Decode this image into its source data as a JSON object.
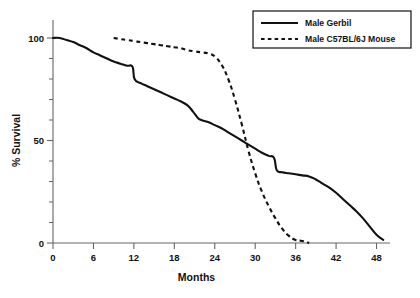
{
  "chart_data": {
    "type": "line",
    "title": "",
    "xlabel": "Months",
    "ylabel": "% Survival",
    "xlim": [
      0,
      50
    ],
    "ylim": [
      0,
      100
    ],
    "xticks": [
      0,
      6,
      12,
      18,
      24,
      30,
      36,
      42,
      48
    ],
    "xtick_labels": [
      "0",
      "6",
      "12",
      "18",
      "24",
      "30",
      "36",
      "42",
      "48"
    ],
    "yticks": [
      0,
      50,
      100
    ],
    "ytick_labels": [
      "0",
      "50",
      "100"
    ],
    "yticks_minor": [
      10,
      20,
      30,
      40,
      60,
      70,
      80,
      90
    ],
    "grid": false,
    "legend_position": "top-right",
    "series": [
      {
        "name": "Male Gerbil",
        "style": "solid",
        "color": "#111111",
        "x": [
          0,
          1,
          2,
          3,
          4,
          5,
          6,
          7,
          8,
          9,
          10,
          11,
          11.8,
          12.1,
          13,
          14,
          15,
          16,
          17,
          18,
          19,
          20,
          20.8,
          21.5,
          22,
          23,
          24,
          25,
          26,
          27,
          28,
          29,
          30,
          31,
          32,
          32.8,
          33.2,
          34,
          35,
          36,
          37,
          38,
          39,
          40,
          41,
          42,
          43,
          44,
          45,
          46,
          47,
          48,
          49
        ],
        "y": [
          100,
          100,
          99,
          98,
          96.5,
          95,
          93,
          91.5,
          90,
          88.5,
          87.5,
          86.5,
          86,
          80,
          78,
          76.5,
          75,
          73.5,
          72,
          70.5,
          69,
          67,
          64,
          61,
          60,
          59,
          57.5,
          56,
          54,
          52,
          50,
          48,
          46,
          44,
          42.5,
          41.5,
          35.5,
          34.5,
          34,
          33.5,
          33,
          32.5,
          31,
          29,
          27,
          24.5,
          21.5,
          18.5,
          15.5,
          12,
          8,
          4,
          1.5
        ]
      },
      {
        "name": "Male C57BL/6J Mouse",
        "style": "dashed",
        "color": "#111111",
        "x": [
          9,
          10,
          11,
          12,
          13,
          14,
          15,
          16,
          17,
          18,
          19,
          20,
          21,
          22,
          23,
          24,
          25,
          26,
          27,
          28,
          29,
          30,
          31,
          32,
          33,
          34,
          35,
          36,
          37,
          38
        ],
        "y": [
          100,
          99.5,
          99,
          98.5,
          98,
          97.5,
          97,
          96.5,
          96,
          95.5,
          95,
          94,
          93.5,
          93,
          92.5,
          91,
          87,
          80,
          70,
          58,
          45,
          34,
          25,
          18,
          12,
          7,
          3.5,
          1.5,
          1,
          0
        ]
      }
    ]
  },
  "legend": {
    "entries": [
      {
        "label": "Male Gerbil",
        "style": "solid"
      },
      {
        "label": "Male C57BL/6J Mouse",
        "style": "dashed"
      }
    ]
  }
}
